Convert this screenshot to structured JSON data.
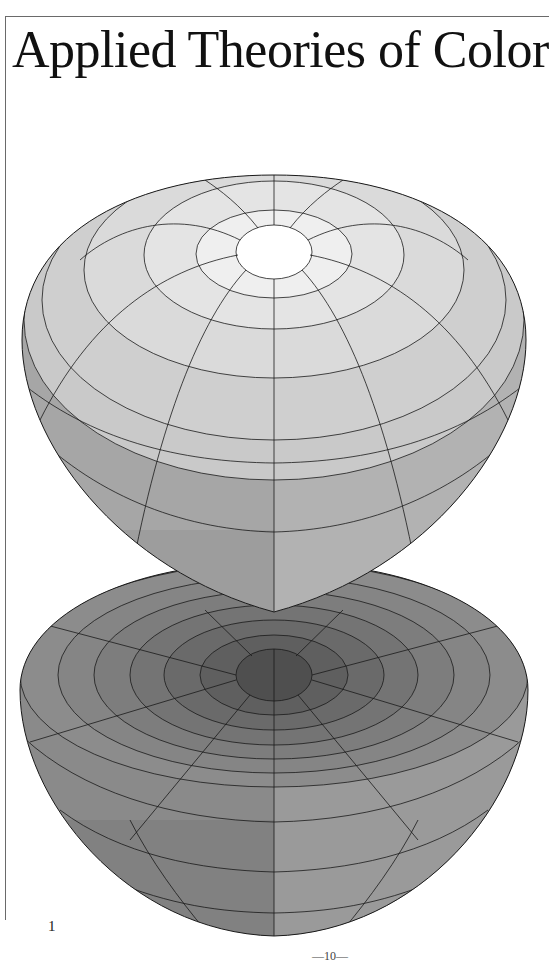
{
  "page": {
    "title": "Applied Theories of Color",
    "figure_number": "1",
    "page_number": "—10—"
  },
  "figure": {
    "colors": {
      "pole_white": "#ffffff",
      "upper_light": "#e6e6e6",
      "upper_mid": "#c4c4c4",
      "upper_side": "#a8a8a8",
      "lower_ring_outer": "#8e8e8e",
      "lower_center": "#4e4e4e",
      "outline": "#1a1a1a"
    }
  }
}
